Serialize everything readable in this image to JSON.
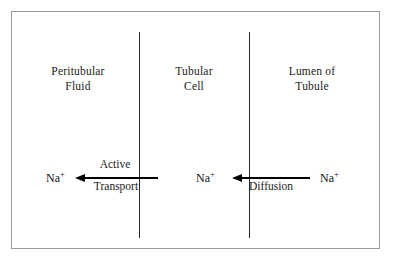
{
  "figure": {
    "border_color": "#9a9a9a",
    "line_color": "#2a2a2a",
    "arrow_color": "#000000",
    "background": "#ffffff"
  },
  "compartments": [
    {
      "id": "peritubular-fluid",
      "label": "Peritubular\nFluid"
    },
    {
      "id": "tubular-cell",
      "label": "Tubular\nCell"
    },
    {
      "id": "lumen-of-tubule",
      "label": "Lumen of\nTubule"
    }
  ],
  "membranes": [
    {
      "id": "basolateral-membrane"
    },
    {
      "id": "luminal-membrane"
    }
  ],
  "ions": [
    {
      "id": "na-peritubular",
      "symbol": "Na",
      "charge": "+"
    },
    {
      "id": "na-cell",
      "symbol": "Na",
      "charge": "+"
    },
    {
      "id": "na-lumen",
      "symbol": "Na",
      "charge": "+"
    }
  ],
  "arrows": [
    {
      "id": "active-transport-arrow",
      "direction": "left",
      "label_above": "Active",
      "label_below": "Transport"
    },
    {
      "id": "diffusion-arrow",
      "direction": "left",
      "label_above": "",
      "label_below": "Diffusion"
    }
  ]
}
